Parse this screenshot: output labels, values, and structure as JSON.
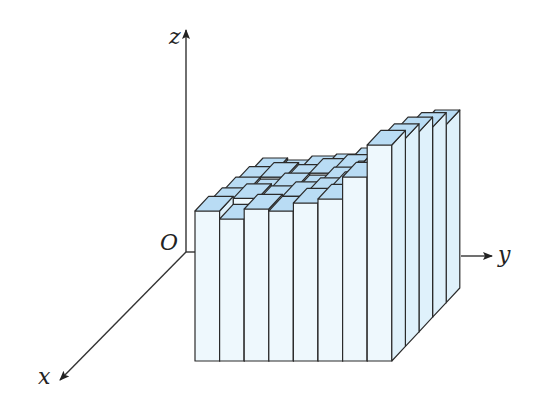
{
  "diagram": {
    "type": "3d-bar-grid",
    "axes": {
      "x_label": "x",
      "y_label": "y",
      "z_label": "z",
      "origin_label": "O"
    },
    "colors": {
      "top_face": "#b9dcf4",
      "front_face": "#eef8fd",
      "side_face": "#dff1fb",
      "edge": "#2b2b2b",
      "axis": "#333333"
    },
    "grid": {
      "columns_along_y": 8,
      "rows_along_x": 5,
      "heights": [
        [
          130,
          128,
          132,
          134,
          140,
          146,
          158,
          178
        ],
        [
          136,
          140,
          138,
          144,
          148,
          150,
          166,
          190
        ],
        [
          140,
          138,
          144,
          142,
          150,
          156,
          168,
          200
        ],
        [
          144,
          148,
          146,
          150,
          154,
          160,
          176,
          208
        ],
        [
          150,
          142,
          152,
          150,
          158,
          162,
          184,
          216
        ]
      ]
    }
  }
}
